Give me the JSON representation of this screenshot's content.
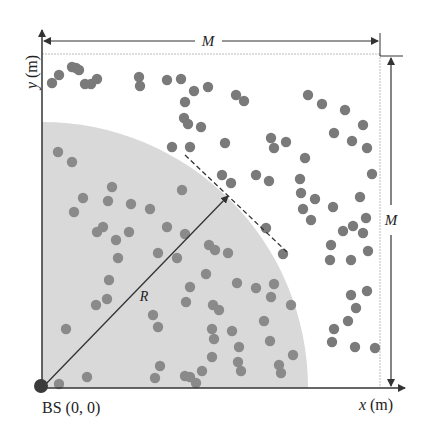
{
  "diagram": {
    "labels": {
      "y_axis": "y (m)",
      "x_axis": "x (m)",
      "origin": "BS (0, 0)",
      "radius": "R",
      "side_top": "M",
      "side_right": "M"
    },
    "colors": {
      "coverage_fill": "#d9d9d9",
      "user_dot": "#7a7a7a",
      "axis": "#333333",
      "base_station": "#3a3a3a",
      "border_dotted": "#bbbbbb"
    },
    "geometry": {
      "origin_px": [
        42,
        388
      ],
      "radius_px": 266,
      "area_right_px": 380,
      "area_top_px": 54
    },
    "users": [
      [
        59,
        75
      ],
      [
        72,
        67
      ],
      [
        76,
        68
      ],
      [
        79,
        70
      ],
      [
        52,
        83
      ],
      [
        85,
        84
      ],
      [
        91,
        84
      ],
      [
        97,
        79
      ],
      [
        139,
        77
      ],
      [
        140,
        86
      ],
      [
        181,
        79
      ],
      [
        194,
        91
      ],
      [
        208,
        87
      ],
      [
        167,
        80
      ],
      [
        185,
        102
      ],
      [
        201,
        127
      ],
      [
        236,
        95
      ],
      [
        244,
        101
      ],
      [
        184,
        118
      ],
      [
        188,
        124
      ],
      [
        172,
        147
      ],
      [
        190,
        147
      ],
      [
        225,
        143
      ],
      [
        271,
        138
      ],
      [
        274,
        148
      ],
      [
        286,
        142
      ],
      [
        269,
        181
      ],
      [
        308,
        95
      ],
      [
        322,
        104
      ],
      [
        345,
        110
      ],
      [
        334,
        133
      ],
      [
        352,
        141
      ],
      [
        363,
        125
      ],
      [
        367,
        148
      ],
      [
        372,
        174
      ],
      [
        360,
        197
      ],
      [
        366,
        218
      ],
      [
        305,
        158
      ],
      [
        300,
        179
      ],
      [
        301,
        193
      ],
      [
        303,
        209
      ],
      [
        315,
        199
      ],
      [
        311,
        220
      ],
      [
        333,
        207
      ],
      [
        353,
        226
      ],
      [
        343,
        231
      ],
      [
        363,
        233
      ],
      [
        331,
        245
      ],
      [
        368,
        251
      ],
      [
        351,
        260
      ],
      [
        283,
        254
      ],
      [
        266,
        228
      ],
      [
        222,
        175
      ],
      [
        231,
        183
      ],
      [
        256,
        175
      ],
      [
        330,
        260
      ],
      [
        367,
        291
      ],
      [
        351,
        295
      ],
      [
        356,
        308
      ],
      [
        348,
        321
      ],
      [
        334,
        329
      ],
      [
        355,
        347
      ],
      [
        375,
        348
      ],
      [
        332,
        342
      ],
      [
        58,
        152
      ],
      [
        72,
        162
      ],
      [
        112,
        187
      ],
      [
        108,
        201
      ],
      [
        83,
        198
      ],
      [
        74,
        212
      ],
      [
        131,
        204
      ],
      [
        150,
        209
      ],
      [
        182,
        190
      ],
      [
        97,
        232
      ],
      [
        116,
        240
      ],
      [
        103,
        227
      ],
      [
        129,
        232
      ],
      [
        167,
        227
      ],
      [
        185,
        234
      ],
      [
        158,
        253
      ],
      [
        177,
        258
      ],
      [
        209,
        245
      ],
      [
        215,
        250
      ],
      [
        228,
        253
      ],
      [
        118,
        258
      ],
      [
        206,
        274
      ],
      [
        190,
        287
      ],
      [
        186,
        302
      ],
      [
        213,
        305
      ],
      [
        237,
        283
      ],
      [
        219,
        310
      ],
      [
        212,
        329
      ],
      [
        256,
        288
      ],
      [
        274,
        284
      ],
      [
        271,
        297
      ],
      [
        264,
        321
      ],
      [
        291,
        305
      ],
      [
        107,
        299
      ],
      [
        153,
        315
      ],
      [
        158,
        327
      ],
      [
        96,
        305
      ],
      [
        109,
        280
      ],
      [
        232,
        331
      ],
      [
        214,
        339
      ],
      [
        212,
        357
      ],
      [
        241,
        371
      ],
      [
        238,
        362
      ],
      [
        185,
        376
      ],
      [
        190,
        377
      ],
      [
        202,
        371
      ],
      [
        196,
        383
      ],
      [
        160,
        366
      ],
      [
        66,
        329
      ],
      [
        87,
        377
      ],
      [
        59,
        384
      ],
      [
        155,
        378
      ],
      [
        239,
        347
      ],
      [
        270,
        341
      ],
      [
        293,
        355
      ],
      [
        281,
        373
      ],
      [
        279,
        365
      ],
      [
        301,
        397
      ]
    ]
  }
}
